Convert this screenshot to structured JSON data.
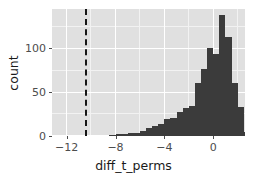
{
  "chart_data": {
    "type": "bar",
    "subtype": "histogram",
    "title": "",
    "subtitle": "",
    "xlabel": "diff_t_perms",
    "ylabel": "count",
    "xlim": [
      -13.2,
      2.6
    ],
    "ylim": [
      0,
      145
    ],
    "xticks": [
      -12,
      -8,
      -4,
      0
    ],
    "xtick_labels": [
      "-12",
      "-8",
      "-4",
      "0"
    ],
    "yticks": [
      0,
      50,
      100
    ],
    "ytick_labels": [
      "0",
      "50",
      "100"
    ],
    "grid": true,
    "legend": false,
    "bin_width": 0.5,
    "bar_color": "#3b3b3b",
    "panel_color": "#e0e0e0",
    "grid_color": "#ffffff",
    "bins": [
      {
        "x": -8.25,
        "count": 1
      },
      {
        "x": -7.75,
        "count": 2
      },
      {
        "x": -7.25,
        "count": 2
      },
      {
        "x": -6.75,
        "count": 3
      },
      {
        "x": -6.25,
        "count": 4
      },
      {
        "x": -5.75,
        "count": 6
      },
      {
        "x": -5.25,
        "count": 9
      },
      {
        "x": -4.75,
        "count": 12
      },
      {
        "x": -4.25,
        "count": 14
      },
      {
        "x": -3.75,
        "count": 19
      },
      {
        "x": -3.25,
        "count": 21
      },
      {
        "x": -2.75,
        "count": 27
      },
      {
        "x": -2.25,
        "count": 32
      },
      {
        "x": -1.75,
        "count": 34
      },
      {
        "x": -1.25,
        "count": 60
      },
      {
        "x": -0.75,
        "count": 76
      },
      {
        "x": -0.25,
        "count": 101
      },
      {
        "x": 0.25,
        "count": 94
      },
      {
        "x": 0.75,
        "count": 138
      },
      {
        "x": 1.25,
        "count": 113
      },
      {
        "x": 1.75,
        "count": 60
      },
      {
        "x": 2.25,
        "count": 33
      },
      {
        "x": 2.75,
        "count": 5
      }
    ],
    "vline": {
      "x": -10.5,
      "style": "dashed",
      "color": "#151515"
    }
  }
}
